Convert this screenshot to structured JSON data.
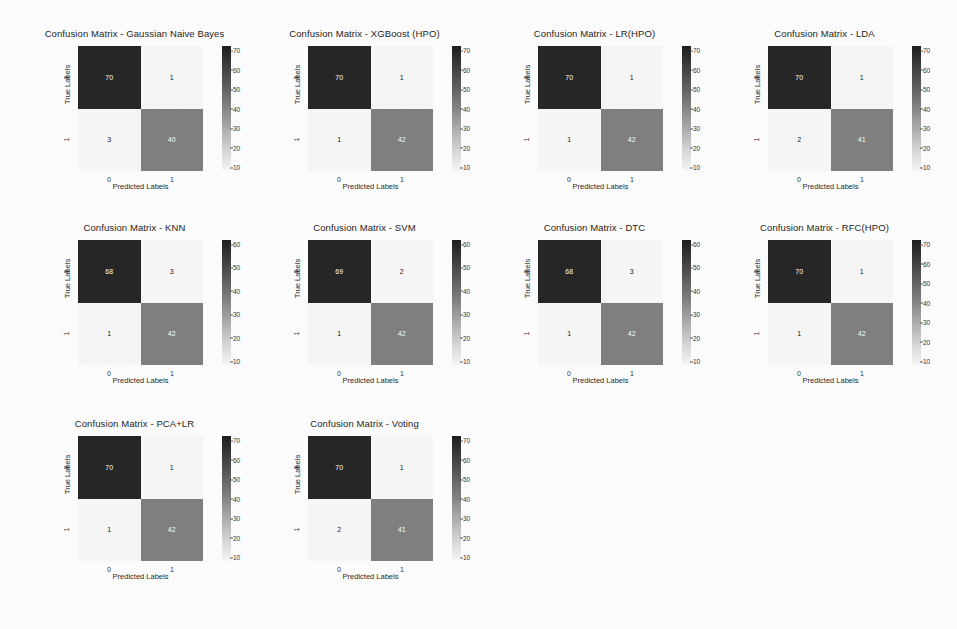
{
  "figure": {
    "background_color": "#fdfdfd",
    "grid_columns": 4,
    "grid_rows": 3,
    "axis_labels": {
      "x": "Predicted Labels",
      "y": "True Labels"
    },
    "tick_labels": {
      "x": [
        "0",
        "1"
      ],
      "y": [
        "0",
        "1"
      ]
    },
    "colormap": "gray_r",
    "dark_cell_color": "#262626",
    "mid_cell_color": "#808080",
    "light_cell_color": "#f7f7f7"
  },
  "chart_data": [
    {
      "type": "heatmap",
      "title": "Confusion Matrix - Gaussian Naive Bayes",
      "xlabel": "Predicted Labels",
      "ylabel": "True Labels",
      "x_ticklabels": [
        "0",
        "1"
      ],
      "y_ticklabels": [
        "0",
        "1"
      ],
      "matrix": [
        [
          70,
          1
        ],
        [
          3,
          40
        ]
      ],
      "cells": [
        {
          "row": 0,
          "col": 0,
          "value": "70",
          "color": "#262626",
          "text_color": "#ffffff"
        },
        {
          "row": 0,
          "col": 1,
          "value": "1",
          "color": "#f7f7f7",
          "text_color": "#1a1a1a"
        },
        {
          "row": 1,
          "col": 0,
          "value": "3",
          "color": "#f7f7f7",
          "text_color": "#1a1a1a"
        },
        {
          "row": 1,
          "col": 1,
          "value": "40",
          "color": "#808080",
          "text_color": "#ffffff"
        }
      ],
      "colorbar": {
        "ticks": [
          "70",
          "60",
          "50",
          "40",
          "30",
          "20",
          "10"
        ],
        "vmin": 1,
        "vmax": 70
      }
    },
    {
      "type": "heatmap",
      "title": "Confusion Matrix - XGBoost (HPO)",
      "xlabel": "Predicted Labels",
      "ylabel": "True Labels",
      "x_ticklabels": [
        "0",
        "1"
      ],
      "y_ticklabels": [
        "0",
        "1"
      ],
      "matrix": [
        [
          70,
          1
        ],
        [
          1,
          42
        ]
      ],
      "cells": [
        {
          "row": 0,
          "col": 0,
          "value": "70",
          "color": "#262626",
          "text_color": "#ffffff"
        },
        {
          "row": 0,
          "col": 1,
          "value": "1",
          "color": "#f7f7f7",
          "text_color": "#1a1a1a"
        },
        {
          "row": 1,
          "col": 0,
          "value": "1",
          "color": "#f7f7f7",
          "text_color": "#1a1a1a"
        },
        {
          "row": 1,
          "col": 1,
          "value": "42",
          "color": "#808080",
          "text_color": "#ffffff"
        }
      ],
      "colorbar": {
        "ticks": [
          "70",
          "60",
          "50",
          "40",
          "30",
          "20",
          "10"
        ],
        "vmin": 1,
        "vmax": 70
      }
    },
    {
      "type": "heatmap",
      "title": "Confusion Matrix - LR(HPO)",
      "xlabel": "Predicted Labels",
      "ylabel": "True Labels",
      "x_ticklabels": [
        "0",
        "1"
      ],
      "y_ticklabels": [
        "0",
        "1"
      ],
      "matrix": [
        [
          70,
          1
        ],
        [
          1,
          42
        ]
      ],
      "cells": [
        {
          "row": 0,
          "col": 0,
          "value": "70",
          "color": "#262626",
          "text_color": "#ffffff"
        },
        {
          "row": 0,
          "col": 1,
          "value": "1",
          "color": "#f7f7f7",
          "text_color": "#1a1a1a"
        },
        {
          "row": 1,
          "col": 0,
          "value": "1",
          "color": "#f7f7f7",
          "text_color": "#1a1a1a"
        },
        {
          "row": 1,
          "col": 1,
          "value": "42",
          "color": "#808080",
          "text_color": "#ffffff"
        }
      ],
      "colorbar": {
        "ticks": [
          "70",
          "60",
          "50",
          "40",
          "30",
          "20",
          "10"
        ],
        "vmin": 1,
        "vmax": 70
      }
    },
    {
      "type": "heatmap",
      "title": "Confusion Matrix - LDA",
      "xlabel": "Predicted Labels",
      "ylabel": "True Labels",
      "x_ticklabels": [
        "0",
        "1"
      ],
      "y_ticklabels": [
        "0",
        "1"
      ],
      "matrix": [
        [
          70,
          1
        ],
        [
          2,
          41
        ]
      ],
      "cells": [
        {
          "row": 0,
          "col": 0,
          "value": "70",
          "color": "#262626",
          "text_color": "#ffffff"
        },
        {
          "row": 0,
          "col": 1,
          "value": "1",
          "color": "#f7f7f7",
          "text_color": "#1a1a1a"
        },
        {
          "row": 1,
          "col": 0,
          "value": "2",
          "color": "#f7f7f7",
          "text_color": "#1a1a1a"
        },
        {
          "row": 1,
          "col": 1,
          "value": "41",
          "color": "#808080",
          "text_color": "#ffffff"
        }
      ],
      "colorbar": {
        "ticks": [
          "70",
          "60",
          "50",
          "40",
          "30",
          "20",
          "10"
        ],
        "vmin": 1,
        "vmax": 70
      }
    },
    {
      "type": "heatmap",
      "title": "Confusion Matrix - KNN",
      "xlabel": "Predicted Labels",
      "ylabel": "True Labels",
      "x_ticklabels": [
        "0",
        "1"
      ],
      "y_ticklabels": [
        "0",
        "1"
      ],
      "matrix": [
        [
          68,
          3
        ],
        [
          1,
          42
        ]
      ],
      "cells": [
        {
          "row": 0,
          "col": 0,
          "value": "68",
          "color": "#262626",
          "text_color": "#ffffff"
        },
        {
          "row": 0,
          "col": 1,
          "value": "3",
          "color": "#f7f7f7",
          "text_color": "#1a1a1a"
        },
        {
          "row": 1,
          "col": 0,
          "value": "1",
          "color": "#f7f7f7",
          "text_color": "#1a1a1a"
        },
        {
          "row": 1,
          "col": 1,
          "value": "42",
          "color": "#808080",
          "text_color": "#ffffff"
        }
      ],
      "colorbar": {
        "ticks": [
          "60",
          "50",
          "40",
          "30",
          "20",
          "10"
        ],
        "vmin": 1,
        "vmax": 68
      }
    },
    {
      "type": "heatmap",
      "title": "Confusion Matrix - SVM",
      "xlabel": "Predicted Labels",
      "ylabel": "True Labels",
      "x_ticklabels": [
        "0",
        "1"
      ],
      "y_ticklabels": [
        "0",
        "1"
      ],
      "matrix": [
        [
          69,
          2
        ],
        [
          1,
          42
        ]
      ],
      "cells": [
        {
          "row": 0,
          "col": 0,
          "value": "69",
          "color": "#262626",
          "text_color": "#ffffff"
        },
        {
          "row": 0,
          "col": 1,
          "value": "2",
          "color": "#f7f7f7",
          "text_color": "#1a1a1a"
        },
        {
          "row": 1,
          "col": 0,
          "value": "1",
          "color": "#f7f7f7",
          "text_color": "#1a1a1a"
        },
        {
          "row": 1,
          "col": 1,
          "value": "42",
          "color": "#808080",
          "text_color": "#ffffff"
        }
      ],
      "colorbar": {
        "ticks": [
          "60",
          "50",
          "40",
          "30",
          "20",
          "10"
        ],
        "vmin": 1,
        "vmax": 69
      }
    },
    {
      "type": "heatmap",
      "title": "Confusion Matrix - DTC",
      "xlabel": "Predicted Labels",
      "ylabel": "True Labels",
      "x_ticklabels": [
        "0",
        "1"
      ],
      "y_ticklabels": [
        "0",
        "1"
      ],
      "matrix": [
        [
          68,
          3
        ],
        [
          1,
          42
        ]
      ],
      "cells": [
        {
          "row": 0,
          "col": 0,
          "value": "68",
          "color": "#262626",
          "text_color": "#ffffff"
        },
        {
          "row": 0,
          "col": 1,
          "value": "3",
          "color": "#f7f7f7",
          "text_color": "#1a1a1a"
        },
        {
          "row": 1,
          "col": 0,
          "value": "1",
          "color": "#f7f7f7",
          "text_color": "#1a1a1a"
        },
        {
          "row": 1,
          "col": 1,
          "value": "42",
          "color": "#808080",
          "text_color": "#ffffff"
        }
      ],
      "colorbar": {
        "ticks": [
          "60",
          "50",
          "40",
          "30",
          "20",
          "10"
        ],
        "vmin": 1,
        "vmax": 68
      }
    },
    {
      "type": "heatmap",
      "title": "Confusion Matrix - RFC(HPO)",
      "xlabel": "Predicted Labels",
      "ylabel": "True Labels",
      "x_ticklabels": [
        "0",
        "1"
      ],
      "y_ticklabels": [
        "0",
        "1"
      ],
      "matrix": [
        [
          70,
          1
        ],
        [
          1,
          42
        ]
      ],
      "cells": [
        {
          "row": 0,
          "col": 0,
          "value": "70",
          "color": "#262626",
          "text_color": "#ffffff"
        },
        {
          "row": 0,
          "col": 1,
          "value": "1",
          "color": "#f7f7f7",
          "text_color": "#1a1a1a"
        },
        {
          "row": 1,
          "col": 0,
          "value": "1",
          "color": "#f7f7f7",
          "text_color": "#1a1a1a"
        },
        {
          "row": 1,
          "col": 1,
          "value": "42",
          "color": "#808080",
          "text_color": "#ffffff"
        }
      ],
      "colorbar": {
        "ticks": [
          "70",
          "60",
          "50",
          "40",
          "30",
          "20",
          "10"
        ],
        "vmin": 1,
        "vmax": 70
      }
    },
    {
      "type": "heatmap",
      "title": "Confusion Matrix - PCA+LR",
      "xlabel": "Predicted Labels",
      "ylabel": "True Labels",
      "x_ticklabels": [
        "0",
        "1"
      ],
      "y_ticklabels": [
        "0",
        "1"
      ],
      "matrix": [
        [
          70,
          1
        ],
        [
          1,
          42
        ]
      ],
      "cells": [
        {
          "row": 0,
          "col": 0,
          "value": "70",
          "color": "#262626",
          "text_color": "#ffffff"
        },
        {
          "row": 0,
          "col": 1,
          "value": "1",
          "color": "#f7f7f7",
          "text_color": "#1a1a1a"
        },
        {
          "row": 1,
          "col": 0,
          "value": "1",
          "color": "#f7f7f7",
          "text_color": "#1a1a1a"
        },
        {
          "row": 1,
          "col": 1,
          "value": "42",
          "color": "#808080",
          "text_color": "#ffffff"
        }
      ],
      "colorbar": {
        "ticks": [
          "70",
          "60",
          "50",
          "40",
          "30",
          "20",
          "10"
        ],
        "vmin": 1,
        "vmax": 70
      }
    },
    {
      "type": "heatmap",
      "title": "Confusion Matrix - Voting",
      "xlabel": "Predicted Labels",
      "ylabel": "True Labels",
      "x_ticklabels": [
        "0",
        "1"
      ],
      "y_ticklabels": [
        "0",
        "1"
      ],
      "matrix": [
        [
          70,
          1
        ],
        [
          2,
          41
        ]
      ],
      "cells": [
        {
          "row": 0,
          "col": 0,
          "value": "70",
          "color": "#262626",
          "text_color": "#ffffff"
        },
        {
          "row": 0,
          "col": 1,
          "value": "1",
          "color": "#f7f7f7",
          "text_color": "#1a1a1a"
        },
        {
          "row": 1,
          "col": 0,
          "value": "2",
          "color": "#f7f7f7",
          "text_color": "#1a1a1a"
        },
        {
          "row": 1,
          "col": 1,
          "value": "41",
          "color": "#808080",
          "text_color": "#ffffff"
        }
      ],
      "colorbar": {
        "ticks": [
          "70",
          "60",
          "50",
          "40",
          "30",
          "20",
          "10"
        ],
        "vmin": 1,
        "vmax": 70
      }
    }
  ]
}
